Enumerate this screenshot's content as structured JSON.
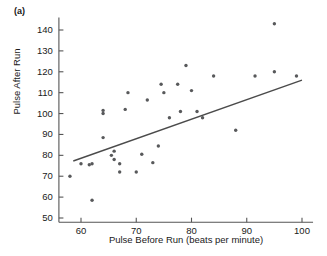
{
  "figure": {
    "panel_label": "(a)",
    "axis_color": "#555555",
    "point_color": "#58595b",
    "line_color": "#4b4b4b",
    "background": "#ffffff"
  },
  "chart_data": {
    "type": "scatter",
    "title": "",
    "xlabel": "Pulse Before Run (beats per minute)",
    "ylabel": "Pulse After Run",
    "xlim": [
      56,
      102
    ],
    "ylim": [
      48,
      146
    ],
    "xticks": [
      60,
      70,
      80,
      90,
      100
    ],
    "yticks": [
      50,
      60,
      70,
      80,
      90,
      100,
      110,
      120,
      130,
      140
    ],
    "grid": false,
    "legend": null,
    "series": [
      {
        "name": "Pulse measurements",
        "marker": "dot",
        "x": [
          58.0,
          60.0,
          61.5,
          62.0,
          62.0,
          64.0,
          64.0,
          64.0,
          65.5,
          66.0,
          66.0,
          67.0,
          67.0,
          68.0,
          68.5,
          70.0,
          71.0,
          72.0,
          73.0,
          74.0,
          74.5,
          75.0,
          76.0,
          77.5,
          78.0,
          79.0,
          80.0,
          81.0,
          82.0,
          84.0,
          88.0,
          91.5,
          95.0,
          95.0,
          99.0
        ],
        "y": [
          70.0,
          76.0,
          75.5,
          76.0,
          58.5,
          100.0,
          101.5,
          88.5,
          80.0,
          82.0,
          78.0,
          76.0,
          72.0,
          102.0,
          110.0,
          72.0,
          80.5,
          106.5,
          76.5,
          84.5,
          114.0,
          110.0,
          98.0,
          114.0,
          101.0,
          123.0,
          111.0,
          101.0,
          98.0,
          118.0,
          92.0,
          118.0,
          143.0,
          120.0,
          118.0
        ]
      }
    ],
    "fit_line": {
      "name": "least-squares regression line",
      "x_start": 58.6,
      "y_start": 77.3,
      "x_end": 100.0,
      "y_end": 116.0
    }
  }
}
